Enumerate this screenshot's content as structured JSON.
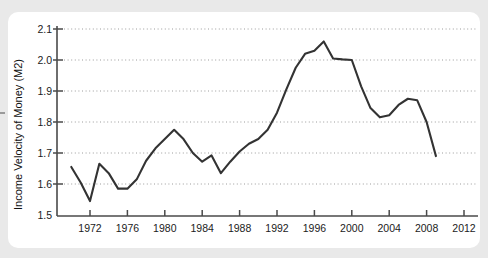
{
  "page": {
    "background_color": "#e9e9e9",
    "card_color": "#ffffff"
  },
  "chart_data": {
    "type": "line",
    "title": "",
    "xlabel": "",
    "ylabel": "Income Velocity of Money (M2)",
    "xlim": [
      1970,
      2013
    ],
    "ylim": [
      1.5,
      2.13
    ],
    "xticks": [
      1972,
      1976,
      1980,
      1984,
      1988,
      1992,
      1996,
      2000,
      2004,
      2008,
      2012
    ],
    "xtick_labels": [
      "1972",
      "1976",
      "1980",
      "1984",
      "1988",
      "1992",
      "1996",
      "2000",
      "2004",
      "2008",
      "2012"
    ],
    "yticks": [
      1.5,
      1.6,
      1.7,
      1.8,
      1.9,
      2.0,
      2.1
    ],
    "ytick_labels": [
      "1.5",
      "1.6",
      "1.7",
      "1.8",
      "1.9",
      "2.0",
      "2.1"
    ],
    "grid": "horizontal-dotted",
    "legend": "none",
    "line_color": "#333333",
    "line_width": 2.1,
    "grid_color": "#9c9c9c",
    "axis_color": "#555555",
    "series": [
      {
        "name": "Income Velocity of Money (M2)",
        "x": [
          1970,
          1971,
          1972,
          1973,
          1974,
          1975,
          1976,
          1977,
          1978,
          1979,
          1980,
          1981,
          1982,
          1983,
          1984,
          1985,
          1986,
          1987,
          1988,
          1989,
          1990,
          1991,
          1992,
          1993,
          1994,
          1995,
          1996,
          1997,
          1998,
          1999,
          2000,
          2001,
          2002,
          2003,
          2004,
          2005,
          2006,
          2007,
          2008,
          2009
        ],
        "values": [
          1.655,
          1.605,
          1.545,
          1.665,
          1.635,
          1.585,
          1.585,
          1.615,
          1.675,
          1.715,
          1.745,
          1.775,
          1.745,
          1.7,
          1.672,
          1.692,
          1.635,
          1.672,
          1.705,
          1.73,
          1.745,
          1.775,
          1.83,
          1.905,
          1.975,
          2.02,
          2.03,
          2.06,
          2.005,
          2.002,
          2.0,
          1.915,
          1.845,
          1.815,
          1.822,
          1.855,
          1.875,
          1.87,
          1.8,
          1.69
        ]
      }
    ]
  },
  "yaxis_title": {
    "text": "Income Velocity of Money (M2)"
  }
}
